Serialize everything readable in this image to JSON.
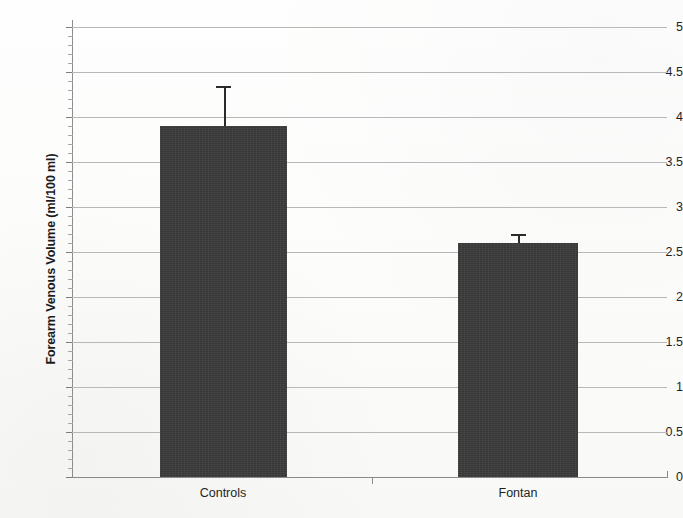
{
  "chart_data": {
    "type": "bar",
    "title": "",
    "xlabel": "",
    "ylabel": "Forearm Venous Volume (ml/100 ml)",
    "categories": [
      "Controls",
      "Fontan"
    ],
    "values": [
      3.9,
      2.6
    ],
    "errors": [
      0.45,
      0.1
    ],
    "error_type": "upper-only",
    "ylim": [
      0,
      5
    ],
    "ytick_step": 0.5,
    "yticks": [
      0,
      0.5,
      1,
      1.5,
      2,
      2.5,
      3,
      3.5,
      4,
      4.5,
      5
    ],
    "ytick_labels": [
      "0",
      "0.5",
      "1",
      "1.5",
      "2",
      "2.5",
      "3",
      "3.5",
      "4",
      "4.5",
      "5"
    ],
    "minor_tick_step": 0.1,
    "grid": true,
    "grid_axis": "y",
    "legend": false,
    "legend_position": "none",
    "series": [
      {
        "name": "Forearm Venous Volume",
        "values": [
          3.9,
          2.6
        ],
        "errors": [
          0.45,
          0.1
        ],
        "color": "#3b3b3b"
      }
    ],
    "colors": {
      "bar_fill": "#3b3b3b",
      "gridline": "#b8b8b8",
      "axis": "#8a8a8a",
      "text": "#1f1f1f",
      "background": "#fdfdfc"
    }
  },
  "axes": {
    "y_title": "Forearm Venous Volume (ml/100 ml)"
  }
}
